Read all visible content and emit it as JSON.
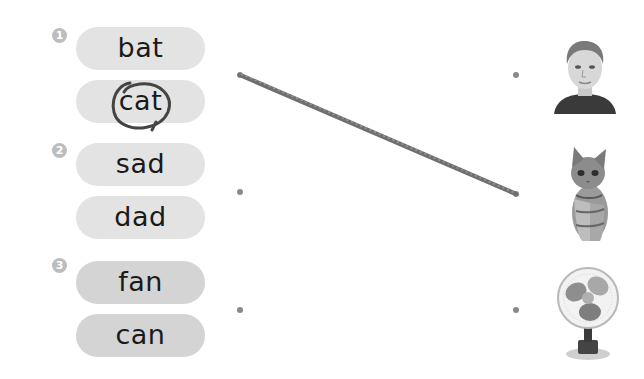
{
  "exercise": {
    "groups": [
      {
        "number": "1",
        "words": [
          "bat",
          "cat"
        ],
        "circled_word_index": 1
      },
      {
        "number": "2",
        "words": [
          "sad",
          "dad"
        ]
      },
      {
        "number": "3",
        "words": [
          "fan",
          "can"
        ]
      }
    ],
    "pictures": [
      {
        "name": "boy",
        "icon": "boy-photo"
      },
      {
        "name": "kitten",
        "icon": "kitten-photo"
      },
      {
        "name": "fan",
        "icon": "desk-fan-photo"
      }
    ],
    "drawn_line": {
      "from": "group-1-dot",
      "to": "picture-2-dot"
    },
    "colors": {
      "pill_light": "#e3e3e3",
      "pill_dark": "#d4d4d4",
      "number_badge": "#bdbdbd",
      "dot": "#8a8a8a",
      "pencil": "#6f6f6f"
    }
  }
}
